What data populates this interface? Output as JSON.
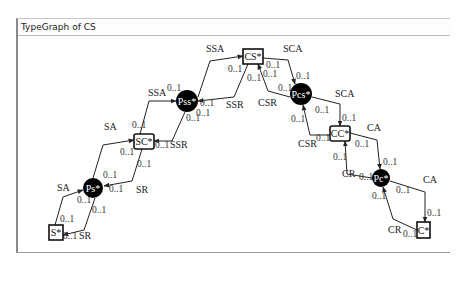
{
  "window": {
    "title": "TypeGraph of CS"
  },
  "nodes": [
    {
      "id": "CS",
      "label": "CS*",
      "shape": "box",
      "x": 243,
      "y": 49,
      "w": 20,
      "h": 15
    },
    {
      "id": "Pss",
      "label": "Pss*",
      "shape": "circle",
      "cx": 187,
      "cy": 101,
      "r": 11
    },
    {
      "id": "Pcs",
      "label": "Pcs*",
      "shape": "circle",
      "cx": 301,
      "cy": 94,
      "r": 11
    },
    {
      "id": "SC",
      "label": "SC*",
      "shape": "box",
      "x": 134,
      "y": 134,
      "w": 20,
      "h": 15
    },
    {
      "id": "CC",
      "label": "CC*",
      "shape": "box",
      "x": 330,
      "y": 126,
      "w": 20,
      "h": 15
    },
    {
      "id": "Ps",
      "label": "Ps*",
      "shape": "circle",
      "cx": 93,
      "cy": 188,
      "r": 10
    },
    {
      "id": "Pc",
      "label": "Pc*",
      "shape": "circle",
      "cx": 381,
      "cy": 178,
      "r": 9
    },
    {
      "id": "S",
      "label": "S*",
      "shape": "box",
      "x": 49,
      "y": 225,
      "w": 14,
      "h": 15
    },
    {
      "id": "C",
      "label": "C*",
      "shape": "box",
      "x": 417,
      "y": 222,
      "w": 13,
      "h": 16
    }
  ],
  "edges": [
    {
      "label": "SSA",
      "from": "Pss",
      "to": "CS",
      "points": "198,97 210,61 243,56",
      "label_pos": [
        206,
        52
      ],
      "src_mult": "0..1",
      "src_pos": [
        196,
        116
      ],
      "dst_mult": "0..1",
      "dst_pos": [
        228,
        72
      ]
    },
    {
      "label": "SSR",
      "from": "CS",
      "to": "Pss",
      "points": "248,64 234,97 198,101",
      "label_pos": [
        226,
        108
      ],
      "src_mult": "0..1",
      "src_pos": [
        247,
        81
      ],
      "dst_mult": "0..1",
      "dst_pos": [
        200,
        106
      ]
    },
    {
      "label": "SCA",
      "from": "CS",
      "to": "Pcs",
      "points": "263,58 288,60 295,84",
      "label_pos": [
        283,
        52
      ],
      "src_mult": "0..1",
      "src_pos": [
        266,
        68
      ],
      "dst_mult": "0..1",
      "dst_pos": [
        296,
        79
      ]
    },
    {
      "label": "CSR",
      "from": "Pcs",
      "to": "CS",
      "points": "290,97 268,91 258,64",
      "label_pos": [
        258,
        106
      ],
      "src_mult": "0..1",
      "src_pos": [
        278,
        91
      ],
      "dst_mult": "0..1",
      "dst_pos": [
        263,
        77
      ]
    },
    {
      "label": "SSA",
      "from": "SC",
      "to": "Pss",
      "points": "140,134 149,101 176,101",
      "label_pos": [
        148,
        96
      ],
      "src_mult": "0..1",
      "src_pos": [
        132,
        128
      ],
      "dst_mult": "0..1",
      "dst_pos": [
        167,
        91
      ]
    },
    {
      "label": "SSR",
      "from": "Pss",
      "to": "SC",
      "points": "185,112 172,141 154,141",
      "label_pos": [
        170,
        148
      ],
      "src_mult": "0..1",
      "src_pos": [
        186,
        121
      ],
      "dst_mult": "0..1",
      "dst_pos": [
        155,
        148
      ]
    },
    {
      "label": "SCA",
      "from": "Pcs",
      "to": "CC",
      "points": "312,97 340,104 340,126",
      "label_pos": [
        335,
        97
      ],
      "src_mult": "0..1",
      "src_pos": [
        315,
        113
      ],
      "dst_mult": "0..1",
      "dst_pos": [
        342,
        121
      ]
    },
    {
      "label": "CSR",
      "from": "CC",
      "to": "Pcs",
      "points": "330,135 310,135 303,105",
      "label_pos": [
        298,
        147
      ],
      "src_mult": "0..1",
      "src_pos": [
        316,
        141
      ],
      "dst_mult": "0..1",
      "dst_pos": [
        291,
        122
      ]
    },
    {
      "label": "SA",
      "from": "Ps",
      "to": "SC",
      "points": "93,178 103,145 134,140",
      "label_pos": [
        104,
        130
      ],
      "src_mult": "0..1",
      "src_pos": [
        103,
        178
      ],
      "dst_mult": "0..1",
      "dst_pos": [
        120,
        155
      ]
    },
    {
      "label": "SR",
      "from": "SC",
      "to": "Ps",
      "points": "142,149 132,181 104,186",
      "label_pos": [
        136,
        193
      ],
      "src_mult": "0..1",
      "src_pos": [
        137,
        167
      ],
      "dst_mult": "0..1",
      "dst_pos": [
        109,
        192
      ]
    },
    {
      "label": "CA",
      "from": "CC",
      "to": "Pc",
      "points": "350,133 377,140 380,169",
      "label_pos": [
        367,
        131
      ],
      "src_mult": "0..1",
      "src_pos": [
        355,
        147
      ],
      "dst_mult": "0..1",
      "dst_pos": [
        383,
        165
      ]
    },
    {
      "label": "CR",
      "from": "Pc",
      "to": "CC",
      "points": "372,178 347,174 345,141",
      "label_pos": [
        342,
        177
      ],
      "src_mult": "0..1",
      "src_pos": [
        359,
        180
      ],
      "dst_mult": "0..1",
      "dst_pos": [
        333,
        160
      ]
    },
    {
      "label": "CA",
      "from": "Pc",
      "to": "C",
      "points": "390,181 425,192 425,222",
      "label_pos": [
        423,
        183
      ],
      "src_mult": "0..1",
      "src_pos": [
        396,
        193
      ],
      "dst_mult": "0..1",
      "dst_pos": [
        427,
        216
      ]
    },
    {
      "label": "CR",
      "from": "C",
      "to": "Pc",
      "points": "417,230 393,219 383,187",
      "label_pos": [
        388,
        233
      ],
      "src_mult": "0..1",
      "src_pos": [
        403,
        237
      ],
      "dst_mult": "0..1",
      "dst_pos": [
        372,
        199
      ]
    },
    {
      "label": "SA",
      "from": "S",
      "to": "Ps",
      "points": "55,225 63,197 83,190",
      "label_pos": [
        57,
        191
      ],
      "src_mult": "0..1",
      "src_pos": [
        60,
        222
      ],
      "dst_mult": "0..1",
      "dst_pos": [
        77,
        203
      ]
    },
    {
      "label": "SR",
      "from": "Ps",
      "to": "S",
      "points": "95,198 84,230 63,235",
      "label_pos": [
        79,
        239
      ],
      "src_mult": "0..1",
      "src_pos": [
        92,
        213
      ],
      "dst_mult": "0..1",
      "dst_pos": [
        63,
        239
      ]
    }
  ]
}
